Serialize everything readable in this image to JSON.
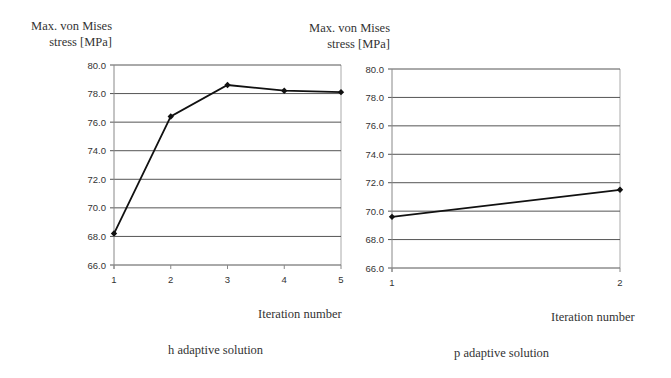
{
  "chart_data": [
    {
      "type": "line",
      "title": "h adaptive solution",
      "xlabel": "Iteration number",
      "ylabel": "Max. von Mises stress [MPa]",
      "ylabel_lines": [
        "Max. von Mises",
        "stress [MPa]"
      ],
      "categories": [
        "1",
        "2",
        "3",
        "4",
        "5"
      ],
      "series": [
        {
          "name": "Max. von Mises stress",
          "values": [
            68.2,
            76.4,
            78.6,
            78.2,
            78.1
          ]
        }
      ],
      "ylim": [
        66.0,
        80.0
      ],
      "yticks": [
        "66.0",
        "68.0",
        "70.0",
        "72.0",
        "74.0",
        "76.0",
        "78.0",
        "80.0"
      ],
      "grid": true,
      "legend": "none",
      "marker": "diamond",
      "line_color": "#111111"
    },
    {
      "type": "line",
      "title": "p adaptive solution",
      "xlabel": "Iteration number",
      "ylabel": "Max. von Mises stress [MPa]",
      "ylabel_lines": [
        "Max. von Mises",
        "stress [MPa]"
      ],
      "categories": [
        "1",
        "2"
      ],
      "series": [
        {
          "name": "Max. von Mises stress",
          "values": [
            69.6,
            71.5
          ]
        }
      ],
      "ylim": [
        66.0,
        80.0
      ],
      "yticks": [
        "66.0",
        "68.0",
        "70.0",
        "72.0",
        "74.0",
        "76.0",
        "78.0",
        "80.0"
      ],
      "grid": true,
      "legend": "none",
      "marker": "diamond",
      "line_color": "#111111"
    }
  ],
  "layout": [
    {
      "x0": 114,
      "x1": 341,
      "y_top": 65,
      "y_bottom": 265
    },
    {
      "x0": 392,
      "x1": 620,
      "y_top": 69,
      "y_bottom": 268
    }
  ],
  "colors": {
    "grid": "#555555",
    "axis": "#888888",
    "frame": "#aaaaaa",
    "series": "#111111"
  }
}
